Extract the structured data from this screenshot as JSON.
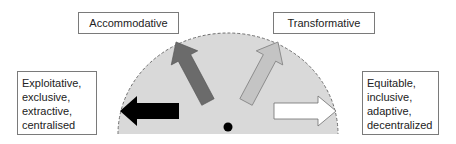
{
  "diagram": {
    "top_labels": {
      "accommodative": "Accommodative",
      "transformative": "Transformative"
    },
    "left_pole": {
      "lines": [
        "Exploitative,",
        "exclusive,",
        "extractive,",
        "centralised"
      ]
    },
    "right_pole": {
      "lines": [
        "Equitable,",
        "inclusive,",
        "adaptive,",
        "decentralized"
      ]
    },
    "semicircle": {
      "fill": "#d9d9d9",
      "outline": "#6e6e6e",
      "outline_style": "dashed"
    },
    "arrows": [
      {
        "name": "exploitative-arrow",
        "direction": "left",
        "fill": "#000000"
      },
      {
        "name": "accommodative-arrow",
        "direction": "up-left",
        "fill": "#6b6b6b"
      },
      {
        "name": "transformative-arrow",
        "direction": "up-right",
        "fill": "#bfbfbf"
      },
      {
        "name": "equitable-arrow",
        "direction": "right",
        "fill": "#ffffff"
      }
    ],
    "center_dot": {
      "fill": "#000000"
    }
  }
}
